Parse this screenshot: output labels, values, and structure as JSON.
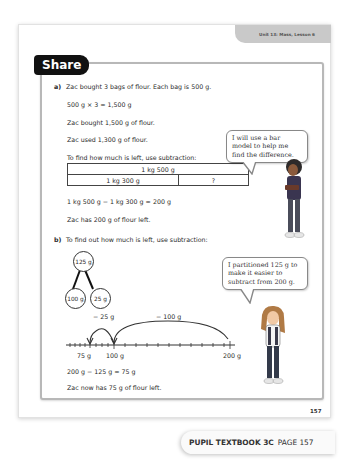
{
  "header": {
    "unit_lesson": "Unit 13: Mass, Lesson 6"
  },
  "section": {
    "title": "Share"
  },
  "part_a": {
    "label": "a)",
    "lines": [
      "Zac bought 3 bags of flour. Each bag is 500 g.",
      "500 g × 3 = 1,500 g",
      "Zac bought 1,500 g of flour.",
      "Zac used 1,300 g of flour.",
      "To find how much is left, use subtraction:"
    ],
    "bar_model": {
      "top": "1 kg 500 g",
      "bottom_left": "1 kg 300 g",
      "bottom_right": "?"
    },
    "equation": "1 kg 500 g − 1 kg 300 g = 200 g",
    "conclusion": "Zac has 200 g of flour left.",
    "speech_bubble": "I will use a bar model to help me find the difference."
  },
  "part_b": {
    "label": "b)",
    "intro": "To find out how much is left, use subtraction:",
    "part_whole": {
      "whole": "125 g",
      "part1": "100 g",
      "part2": "25 g"
    },
    "number_line": {
      "jump1": "− 25 g",
      "jump2": "− 100 g",
      "labels": [
        "75 g",
        "100 g",
        "200 g"
      ]
    },
    "equation": "200 g − 125 g = 75 g",
    "conclusion": "Zac now has 75 g of flour left.",
    "speech_bubble": "I partitioned 125 g to make it easier to subtract from 200 g."
  },
  "footer": {
    "page_number": "157",
    "book": "PUPIL TEXTBOOK 3C",
    "page_label": "PAGE 157"
  },
  "colors": {
    "tab_bg": "#111111",
    "panel_border": "#b8b8b8",
    "unit_tab": "#c9c9c9"
  }
}
